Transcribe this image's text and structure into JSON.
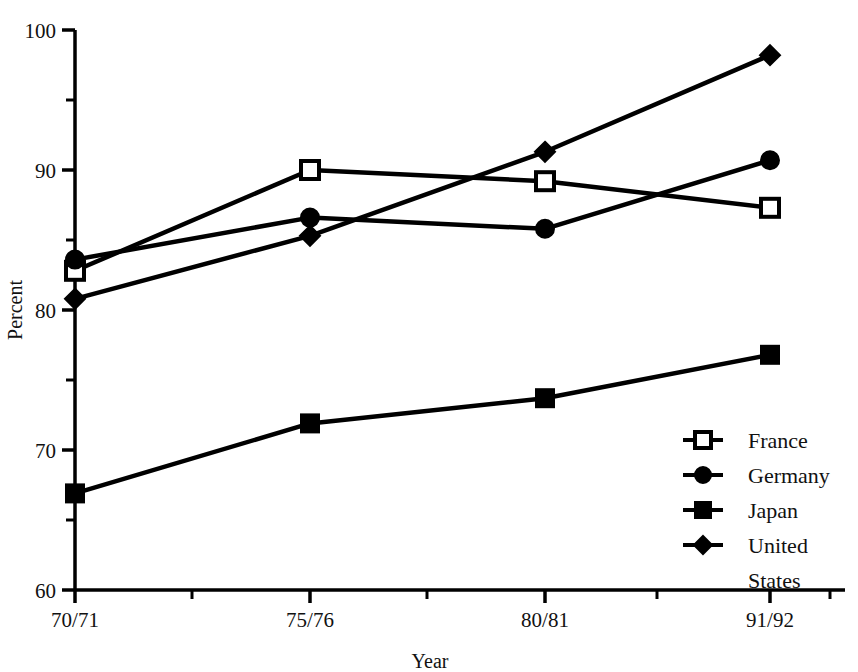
{
  "chart_data": {
    "type": "line",
    "title": "",
    "xlabel": "Year",
    "ylabel": "Percent",
    "categories": [
      "70/71",
      "75/76",
      "80/81",
      "91/92"
    ],
    "ylim": [
      60,
      100
    ],
    "ytick_labels": [
      "60",
      "70",
      "80",
      "90",
      "100"
    ],
    "ytick_values": [
      60,
      70,
      80,
      90,
      100
    ],
    "yminor_values": [
      65,
      75,
      85,
      95
    ],
    "grid": false,
    "legend_position": "inside-lower-right",
    "series": [
      {
        "name": "France",
        "marker": "open-square",
        "color": "#000000",
        "values": [
          82.8,
          90.0,
          89.2,
          87.3
        ]
      },
      {
        "name": "Germany",
        "marker": "filled-circle",
        "color": "#000000",
        "values": [
          83.6,
          86.6,
          85.8,
          90.7
        ]
      },
      {
        "name": "Japan",
        "marker": "filled-square",
        "color": "#000000",
        "values": [
          66.9,
          71.9,
          73.7,
          76.8
        ]
      },
      {
        "name": "United States",
        "marker": "filled-diamond",
        "color": "#000000",
        "values": [
          80.8,
          85.3,
          91.3,
          98.2
        ]
      }
    ]
  },
  "legend": {
    "entries": [
      {
        "label": "France"
      },
      {
        "label": "Germany"
      },
      {
        "label": "Japan"
      },
      {
        "label": "United"
      },
      {
        "label": "States"
      }
    ]
  },
  "axes": {
    "y_title": "Percent",
    "x_title": "Year"
  }
}
